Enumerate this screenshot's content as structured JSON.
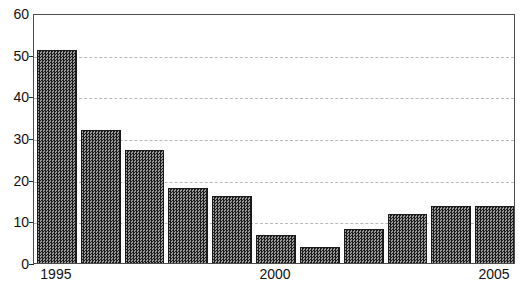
{
  "chart_data": {
    "type": "bar",
    "title": "",
    "subtitle": "",
    "xlabel": "",
    "ylabel": "",
    "categories": [
      "1995",
      "1996",
      "1997",
      "1998",
      "1999",
      "2000",
      "2001",
      "2002",
      "2003",
      "2004",
      "2005"
    ],
    "values": [
      51.5,
      32.5,
      27.5,
      18.5,
      16.5,
      7.2,
      4.3,
      8.6,
      12.3,
      14.1,
      14.1
    ],
    "series": [
      {
        "name": "",
        "values": [
          51.5,
          32.5,
          27.5,
          18.5,
          16.5,
          7.2,
          4.3,
          8.6,
          12.3,
          14.1,
          14.1
        ]
      }
    ],
    "ylim": [
      0,
      60
    ],
    "yticks": [
      0,
      10,
      20,
      30,
      40,
      50,
      60
    ],
    "ytick_labels": [
      "0",
      "10",
      "20",
      "30",
      "40",
      "50",
      "60"
    ],
    "visible_xtick_labels": [
      "1995",
      "2000",
      "2005"
    ],
    "visible_xtick_indices": [
      0,
      5,
      10
    ],
    "grid": true,
    "grid_axis": "y",
    "grid_style": "dashed",
    "grid_color": "#b9b9b9",
    "legend": false,
    "legend_position": "none",
    "bar_fill_color": "#545454",
    "bar_edge_color": "#1a1a1a",
    "plot_border_color": "#4d4d4d",
    "background_color": "#ffffff",
    "text_color": "#111111",
    "annotations": []
  }
}
